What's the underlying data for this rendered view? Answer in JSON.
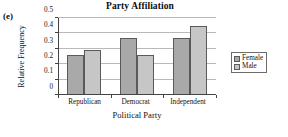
{
  "panel": {
    "label": "(e)"
  },
  "chart_data": {
    "type": "bar",
    "title": "Party Affiliation",
    "xlabel": "Political Party",
    "ylabel": "Relative Frequency",
    "categories": [
      "Republican",
      "Democrat",
      "Independent"
    ],
    "series": [
      {
        "name": "Female",
        "values": [
          0.26,
          0.37,
          0.37
        ],
        "color": "#a9a9a9"
      },
      {
        "name": "Male",
        "values": [
          0.29,
          0.26,
          0.445
        ],
        "color": "#c6c6c6"
      }
    ],
    "ylim": [
      0,
      0.5
    ],
    "yticks": [
      "0",
      "0.1",
      "0.2",
      "0.3",
      "0.4",
      "0.5"
    ],
    "ytick_values": [
      0,
      0.1,
      0.2,
      0.3,
      0.4,
      0.5
    ],
    "grid": true,
    "legend_position": "right"
  },
  "legend": {
    "entries": [
      {
        "label": "Female"
      },
      {
        "label": "Male"
      }
    ]
  }
}
